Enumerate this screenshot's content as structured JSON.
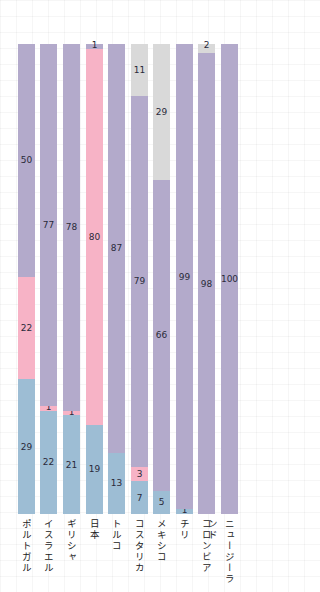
{
  "chart_data": {
    "type": "bar",
    "stacked": true,
    "orientation": "vertical",
    "percent_stacked": true,
    "title": "",
    "xlabel": "",
    "ylabel": "",
    "ylim": [
      0,
      100
    ],
    "grid": true,
    "legend": null,
    "categories": [
      "ポルトガル",
      "イスラエル",
      "ギリシャ",
      "日本",
      "トルコ",
      "コスタリカ",
      "メキシコ",
      "チリ",
      "コロンビア",
      "ニュージーランド"
    ],
    "series": [
      {
        "name": "series_blue",
        "color": "#9dbdd4",
        "values": [
          29,
          22,
          21,
          19,
          13,
          7,
          5,
          1,
          0,
          0
        ]
      },
      {
        "name": "series_pink",
        "color": "#f7b3c6",
        "values": [
          22,
          1,
          1,
          80,
          0,
          3,
          0,
          0,
          0,
          0
        ]
      },
      {
        "name": "series_purple",
        "color": "#b3aacb",
        "values": [
          50,
          77,
          78,
          1,
          87,
          79,
          66,
          99,
          98,
          100
        ]
      },
      {
        "name": "series_gray",
        "color": "#d9d9d9",
        "values": [
          0,
          0,
          0,
          0,
          0,
          11,
          29,
          0,
          2,
          0
        ]
      }
    ]
  }
}
